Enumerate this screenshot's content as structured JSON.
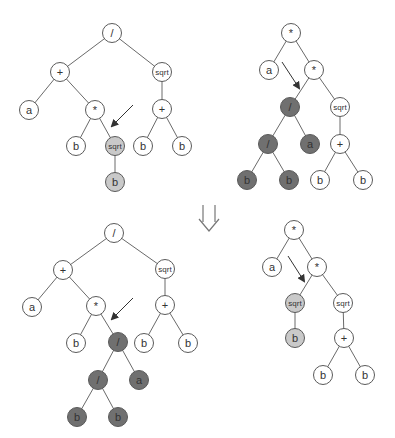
{
  "diagram": {
    "colors": {
      "edge": "#6a6a6a",
      "node_stroke": "#5a5a5a",
      "node_fill": "#ffffff",
      "light": "#c9c9c9",
      "dark": "#707070",
      "arrow": "#333333"
    },
    "trees": [
      {
        "id": "parent-1",
        "nodes": [
          {
            "id": "n0",
            "label": "/",
            "x": 112,
            "y": 33,
            "fill": "white"
          },
          {
            "id": "n1",
            "label": "+",
            "x": 60,
            "y": 72,
            "fill": "white"
          },
          {
            "id": "n2",
            "label": "sqrt",
            "x": 162,
            "y": 72,
            "fill": "white"
          },
          {
            "id": "n3",
            "label": "a",
            "x": 29,
            "y": 110,
            "fill": "white"
          },
          {
            "id": "n4",
            "label": "*",
            "x": 95,
            "y": 110,
            "fill": "white"
          },
          {
            "id": "n5",
            "label": "+",
            "x": 162,
            "y": 109,
            "fill": "white"
          },
          {
            "id": "n6",
            "label": "b",
            "x": 76,
            "y": 146,
            "fill": "white"
          },
          {
            "id": "n7",
            "label": "sqrt",
            "x": 115,
            "y": 146,
            "fill": "light"
          },
          {
            "id": "n8",
            "label": "b",
            "x": 143,
            "y": 146,
            "fill": "white"
          },
          {
            "id": "n9",
            "label": "b",
            "x": 182,
            "y": 146,
            "fill": "white"
          },
          {
            "id": "n10",
            "label": "b",
            "x": 115,
            "y": 182,
            "fill": "light"
          }
        ],
        "edges": [
          [
            "n0",
            "n1"
          ],
          [
            "n0",
            "n2"
          ],
          [
            "n1",
            "n3"
          ],
          [
            "n1",
            "n4"
          ],
          [
            "n2",
            "n5"
          ],
          [
            "n4",
            "n6"
          ],
          [
            "n4",
            "n7"
          ],
          [
            "n5",
            "n8"
          ],
          [
            "n5",
            "n9"
          ],
          [
            "n7",
            "n10"
          ]
        ],
        "arrow": {
          "x1": 133,
          "y1": 105,
          "x2": 112,
          "y2": 126
        }
      },
      {
        "id": "parent-2",
        "nodes": [
          {
            "id": "m0",
            "label": "*",
            "x": 291,
            "y": 33,
            "fill": "white"
          },
          {
            "id": "m1",
            "label": "a",
            "x": 269,
            "y": 70,
            "fill": "white"
          },
          {
            "id": "m2",
            "label": "*",
            "x": 314,
            "y": 70,
            "fill": "white"
          },
          {
            "id": "m3",
            "label": "/",
            "x": 290,
            "y": 107,
            "fill": "dark"
          },
          {
            "id": "m4",
            "label": "sqrt",
            "x": 340,
            "y": 107,
            "fill": "white"
          },
          {
            "id": "m5",
            "label": "/",
            "x": 268,
            "y": 144,
            "fill": "dark"
          },
          {
            "id": "m6",
            "label": "a",
            "x": 310,
            "y": 144,
            "fill": "dark"
          },
          {
            "id": "m7",
            "label": "+",
            "x": 340,
            "y": 144,
            "fill": "white"
          },
          {
            "id": "m8",
            "label": "b",
            "x": 247,
            "y": 180,
            "fill": "dark"
          },
          {
            "id": "m9",
            "label": "b",
            "x": 289,
            "y": 180,
            "fill": "dark"
          },
          {
            "id": "m10",
            "label": "b",
            "x": 320,
            "y": 180,
            "fill": "white"
          },
          {
            "id": "m11",
            "label": "b",
            "x": 363,
            "y": 180,
            "fill": "white"
          }
        ],
        "edges": [
          [
            "m0",
            "m1"
          ],
          [
            "m0",
            "m2"
          ],
          [
            "m2",
            "m3"
          ],
          [
            "m2",
            "m4"
          ],
          [
            "m3",
            "m5"
          ],
          [
            "m3",
            "m6"
          ],
          [
            "m4",
            "m7"
          ],
          [
            "m5",
            "m8"
          ],
          [
            "m5",
            "m9"
          ],
          [
            "m7",
            "m10"
          ],
          [
            "m7",
            "m11"
          ]
        ],
        "arrow": {
          "x1": 282,
          "y1": 62,
          "x2": 299,
          "y2": 88
        }
      },
      {
        "id": "child-1",
        "nodes": [
          {
            "id": "c0",
            "label": "/",
            "x": 114,
            "y": 233,
            "fill": "white"
          },
          {
            "id": "c1",
            "label": "+",
            "x": 63,
            "y": 270,
            "fill": "white"
          },
          {
            "id": "c2",
            "label": "sqrt",
            "x": 165,
            "y": 269,
            "fill": "white"
          },
          {
            "id": "c3",
            "label": "a",
            "x": 32,
            "y": 307,
            "fill": "white"
          },
          {
            "id": "c4",
            "label": "*",
            "x": 96,
            "y": 306,
            "fill": "white"
          },
          {
            "id": "c5",
            "label": "+",
            "x": 165,
            "y": 305,
            "fill": "white"
          },
          {
            "id": "c6",
            "label": "b",
            "x": 76,
            "y": 343,
            "fill": "white"
          },
          {
            "id": "c7",
            "label": "/",
            "x": 118,
            "y": 342,
            "fill": "dark"
          },
          {
            "id": "c8",
            "label": "b",
            "x": 144,
            "y": 343,
            "fill": "white"
          },
          {
            "id": "c9",
            "label": "b",
            "x": 188,
            "y": 343,
            "fill": "white"
          },
          {
            "id": "c10",
            "label": "/",
            "x": 98,
            "y": 380,
            "fill": "dark"
          },
          {
            "id": "c11",
            "label": "a",
            "x": 139,
            "y": 380,
            "fill": "dark"
          },
          {
            "id": "c12",
            "label": "b",
            "x": 77,
            "y": 417,
            "fill": "dark"
          },
          {
            "id": "c13",
            "label": "b",
            "x": 118,
            "y": 417,
            "fill": "dark"
          }
        ],
        "edges": [
          [
            "c0",
            "c1"
          ],
          [
            "c0",
            "c2"
          ],
          [
            "c1",
            "c3"
          ],
          [
            "c1",
            "c4"
          ],
          [
            "c2",
            "c5"
          ],
          [
            "c4",
            "c6"
          ],
          [
            "c4",
            "c7"
          ],
          [
            "c5",
            "c8"
          ],
          [
            "c5",
            "c9"
          ],
          [
            "c7",
            "c10"
          ],
          [
            "c7",
            "c11"
          ],
          [
            "c10",
            "c12"
          ],
          [
            "c10",
            "c13"
          ]
        ],
        "arrow": {
          "x1": 133,
          "y1": 298,
          "x2": 112,
          "y2": 319
        }
      },
      {
        "id": "child-2",
        "nodes": [
          {
            "id": "d0",
            "label": "*",
            "x": 294,
            "y": 230,
            "fill": "white"
          },
          {
            "id": "d1",
            "label": "a",
            "x": 272,
            "y": 267,
            "fill": "white"
          },
          {
            "id": "d2",
            "label": "*",
            "x": 317,
            "y": 267,
            "fill": "white"
          },
          {
            "id": "d3",
            "label": "sqrt",
            "x": 295,
            "y": 303,
            "fill": "light"
          },
          {
            "id": "d4",
            "label": "sqrt",
            "x": 343,
            "y": 303,
            "fill": "white"
          },
          {
            "id": "d5",
            "label": "b",
            "x": 295,
            "y": 338,
            "fill": "light"
          },
          {
            "id": "d6",
            "label": "+",
            "x": 344,
            "y": 338,
            "fill": "white"
          },
          {
            "id": "d7",
            "label": "b",
            "x": 323,
            "y": 375,
            "fill": "white"
          },
          {
            "id": "d8",
            "label": "b",
            "x": 365,
            "y": 375,
            "fill": "white"
          }
        ],
        "edges": [
          [
            "d0",
            "d1"
          ],
          [
            "d0",
            "d2"
          ],
          [
            "d2",
            "d3"
          ],
          [
            "d2",
            "d4"
          ],
          [
            "d3",
            "d5"
          ],
          [
            "d4",
            "d6"
          ],
          [
            "d6",
            "d7"
          ],
          [
            "d6",
            "d8"
          ]
        ],
        "arrow": {
          "x1": 288,
          "y1": 256,
          "x2": 304,
          "y2": 281
        }
      }
    ],
    "transition_arrow": {
      "symbol": "⇓",
      "x": 209,
      "y": 218
    }
  }
}
